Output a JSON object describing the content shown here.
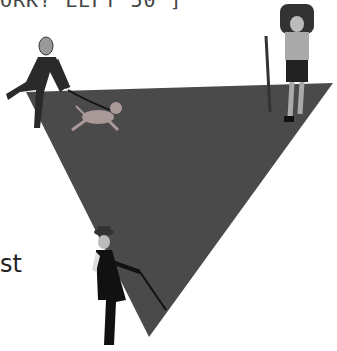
{
  "caption": {
    "top_text_cropped": "ORK? LEFT 50 ]",
    "side_text_fragment": "st"
  },
  "illustration": {
    "shape": "triangle",
    "fill_color": "#4a4a4a",
    "vertices": [
      [
        26,
        92
      ],
      [
        333,
        83
      ],
      [
        149,
        337
      ]
    ],
    "figures": [
      {
        "name": "old-man-walking-dog",
        "position": "top-left"
      },
      {
        "name": "dog",
        "position": "top-left"
      },
      {
        "name": "hiker-with-backpack-and-stick",
        "position": "top-right"
      },
      {
        "name": "man-with-hat-and-cane",
        "position": "bottom"
      }
    ]
  }
}
